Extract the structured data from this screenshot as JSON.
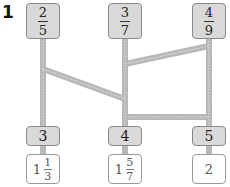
{
  "question_number": "1",
  "top_fractions": [
    {
      "numerator": "2",
      "denominator": "5"
    },
    {
      "numerator": "3",
      "denominator": "7"
    },
    {
      "numerator": "4",
      "denominator": "9"
    }
  ],
  "multipliers": [
    "3",
    "4",
    "5"
  ],
  "answers": [
    {
      "whole": "1",
      "numerator": "1",
      "denominator": "3"
    },
    {
      "whole": "1",
      "numerator": "5",
      "denominator": "7"
    },
    {
      "whole": "2"
    }
  ],
  "colors": {
    "rail": "#b8b8b8",
    "box_fill": "#d9d9d9",
    "border": "#8a8a8a"
  }
}
